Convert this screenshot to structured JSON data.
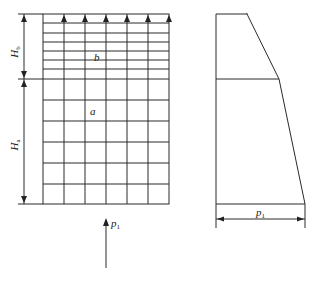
{
  "diagram": {
    "left_panel": {
      "title": "flow grid",
      "zone_upper_label": "b",
      "zone_lower_label": "a",
      "dim_upper": {
        "symbol": "H",
        "subscript": "b"
      },
      "dim_lower": {
        "symbol": "H",
        "subscript": "a"
      },
      "inflow_label": {
        "symbol": "p",
        "subscript": "1"
      },
      "grid": {
        "columns": 6,
        "rows_upper": 7,
        "rows_lower": 6,
        "outflow_arrows": 6
      }
    },
    "right_panel": {
      "title": "pressure distribution",
      "width_label": {
        "symbol": "p",
        "subscript": "1"
      }
    }
  }
}
